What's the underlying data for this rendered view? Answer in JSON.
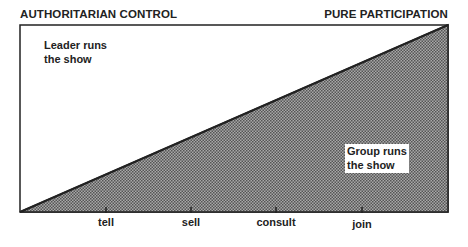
{
  "title_left": "AUTHORITARIAN CONTROL",
  "title_right": "PURE PARTICIPATION",
  "regions": {
    "leader": {
      "line1": "Leader runs",
      "line2": "the show"
    },
    "group": {
      "line1": "Group runs",
      "line2": "the show"
    }
  },
  "scale": {
    "ticks": [
      {
        "label": "tell",
        "x": 106
      },
      {
        "label": "sell",
        "x": 191
      },
      {
        "label": "consult",
        "x": 276
      },
      {
        "label": "join",
        "x": 362
      }
    ]
  },
  "colors": {
    "line": "#222222",
    "hatch_dark": "#555555",
    "hatch_light": "#bbbbbb"
  }
}
